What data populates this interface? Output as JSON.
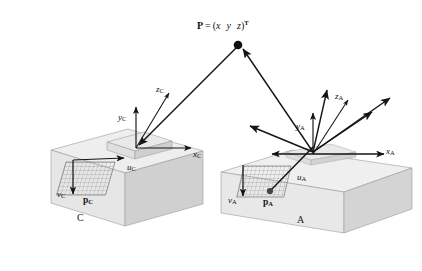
{
  "figure": {
    "title_point": {
      "p_symbol": "P",
      "equals": "=",
      "open": "(",
      "x": "x",
      "y": "y",
      "z": "z",
      "close": ")",
      "transpose": "T"
    },
    "caption": "",
    "background_color": "#ffffff",
    "ink_color": "#141414"
  },
  "camera_frame": {
    "box_label": "C",
    "axes": [
      {
        "name": "z-axis-c",
        "base": "z",
        "sub": "C"
      },
      {
        "name": "y-axis-c",
        "base": "y",
        "sub": "C"
      },
      {
        "name": "x-axis-c",
        "base": "x",
        "sub": "C"
      }
    ],
    "image_axes": [
      {
        "name": "u-axis-c",
        "base": "u",
        "sub": "C"
      },
      {
        "name": "v-axis-c",
        "base": "v",
        "sub": "C"
      }
    ],
    "image_point": {
      "base": "p",
      "sub": "C"
    }
  },
  "array_frame": {
    "box_label": "A",
    "axes": [
      {
        "name": "z-axis-a",
        "base": "z",
        "sub": "A"
      },
      {
        "name": "y-axis-a",
        "base": "y",
        "sub": "A"
      },
      {
        "name": "x-axis-a",
        "base": "x",
        "sub": "A"
      }
    ],
    "image_axes": [
      {
        "name": "u-axis-a",
        "base": "u",
        "sub": "A"
      },
      {
        "name": "v-axis-a",
        "base": "v",
        "sub": "A"
      }
    ],
    "image_point": {
      "base": "p",
      "sub": "A"
    }
  },
  "colors": {
    "box_top": "#ececec",
    "box_front": "#e2e2e2",
    "box_side": "#d2d2d2",
    "box_edge": "#8c8c8c",
    "grid_line": "#7a7a7a",
    "arrow": "#141414"
  }
}
